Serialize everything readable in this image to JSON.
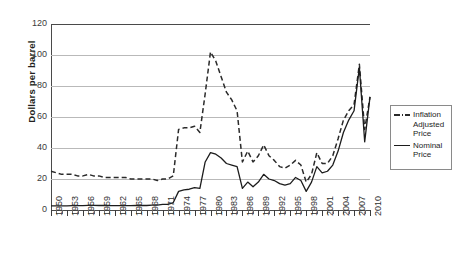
{
  "chart_data": {
    "type": "line",
    "title": "",
    "xlabel": "",
    "ylabel": "Dollars per barrel",
    "xlim": [
      1950,
      2010
    ],
    "ylim": [
      0,
      120
    ],
    "ytick_step": 20,
    "yticks": [
      0,
      20,
      40,
      60,
      80,
      100,
      120
    ],
    "grid": true,
    "legend_position": "right",
    "x": [
      1950,
      1951,
      1952,
      1953,
      1954,
      1955,
      1956,
      1957,
      1958,
      1959,
      1960,
      1961,
      1962,
      1963,
      1964,
      1965,
      1966,
      1967,
      1968,
      1969,
      1970,
      1971,
      1972,
      1973,
      1974,
      1975,
      1976,
      1977,
      1978,
      1979,
      1980,
      1981,
      1982,
      1983,
      1984,
      1985,
      1986,
      1987,
      1988,
      1989,
      1990,
      1991,
      1992,
      1993,
      1994,
      1995,
      1996,
      1997,
      1998,
      1999,
      2000,
      2001,
      2002,
      2003,
      2004,
      2005,
      2006,
      2007,
      2008,
      2009,
      2010
    ],
    "xtick_labels": [
      "1950",
      "1953",
      "1956",
      "1959",
      "1962",
      "1965",
      "1968",
      "1971",
      "1974",
      "1977",
      "1980",
      "1983",
      "1986",
      "1989",
      "1992",
      "1995",
      "1998",
      "2001",
      "2004",
      "2007",
      "2010"
    ],
    "xtick_label_step": 3,
    "series": [
      {
        "name": "Inflation Adjusted Price",
        "style": "dashed",
        "color": "#2a2a2a",
        "values": [
          25,
          24,
          23,
          23,
          23,
          22,
          22,
          23,
          22,
          22,
          21,
          21,
          21,
          21,
          21,
          20,
          20,
          20,
          20,
          20,
          19,
          20,
          20,
          22,
          52,
          53,
          53,
          54,
          50,
          75,
          102,
          96,
          86,
          76,
          71,
          64,
          31,
          38,
          31,
          35,
          42,
          35,
          32,
          28,
          27,
          29,
          32,
          29,
          18,
          23,
          37,
          30,
          30,
          35,
          46,
          58,
          64,
          68,
          94,
          52,
          73
        ]
      },
      {
        "name": "Nominal Price",
        "style": "solid",
        "color": "#1c1c1c",
        "values": [
          2.6,
          2.6,
          2.6,
          2.7,
          2.8,
          2.8,
          2.8,
          3.0,
          3.0,
          2.9,
          2.9,
          2.8,
          2.8,
          2.8,
          2.8,
          2.8,
          2.9,
          2.9,
          2.9,
          3.1,
          3.2,
          3.6,
          3.6,
          4.8,
          12,
          13,
          13.4,
          14.4,
          14,
          31,
          37,
          36,
          33.5,
          30,
          29,
          28,
          14,
          18,
          15,
          18,
          23,
          20,
          19,
          17,
          16,
          17,
          21,
          19,
          12,
          18,
          28,
          24,
          25,
          29,
          38,
          50,
          58,
          64,
          92,
          44,
          73
        ]
      }
    ],
    "annotations": []
  },
  "legend": {
    "items": [
      {
        "label_line1": "Inflation",
        "label_line2": "Adjusted",
        "label_line3": "Price"
      },
      {
        "label_line1": "Nominal",
        "label_line2": "Price"
      }
    ]
  }
}
